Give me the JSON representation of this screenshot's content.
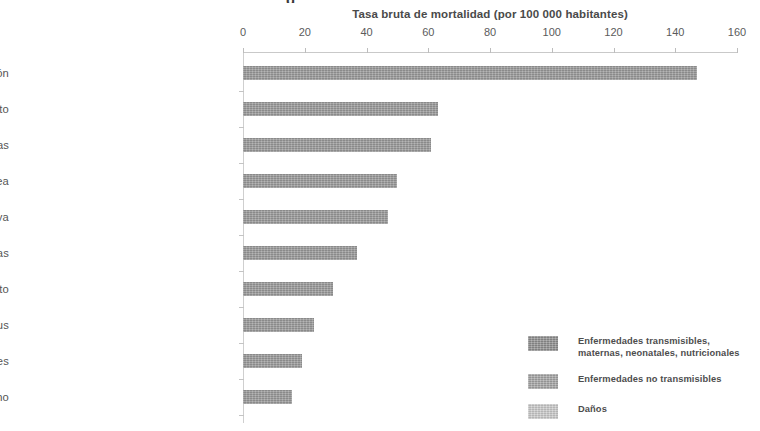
{
  "figure": {
    "clipped_title_fragment": "g",
    "axis_title": "Tasa bruta de mortalidad (por 100 000 habitantes)"
  },
  "legend": {
    "position": "bottom-right",
    "items": [
      {
        "label_line1": "Enfermedades transmisibles,",
        "label_line2": "maternas, neonatales, nutricionales",
        "color": "#8f8f8f"
      },
      {
        "label_line1": "Enfermedades no transmisibles",
        "label_line2": "",
        "color": "#a5a5a5"
      },
      {
        "label_line1": "Daños",
        "label_line2": "",
        "color": "#cacaca"
      }
    ]
  },
  "chart_data": {
    "type": "bar",
    "orientation": "horizontal",
    "title": "",
    "xlabel": "Tasa bruta de mortalidad (por 100 000 habitantes)",
    "ylabel": "",
    "xlim": [
      0,
      160
    ],
    "xticks": [
      0,
      20,
      40,
      60,
      80,
      100,
      120,
      140,
      160
    ],
    "grid": false,
    "legend_position": "bottom-right",
    "bar_color": "#9a9a9a",
    "categories": [
      "Enfermedad isquémica del corazón",
      "Infarto",
      "Alzheimer y otras demencias",
      "Cánceres de pulmón, tráquea",
      "Enfermedad pulmonar obstructiva",
      "Infecciones respiratorias",
      "Cáncer de colon y recto",
      "Diabetes mellitus",
      "Enfermedades renales",
      "Cáncer de pecho"
    ],
    "values": [
      147,
      63,
      61,
      50,
      47,
      37,
      29,
      23,
      19,
      16
    ],
    "series": [
      {
        "name": "Enfermedades no transmisibles",
        "values": [
          147,
          63,
          61,
          50,
          47,
          37,
          29,
          23,
          19,
          16
        ]
      }
    ]
  }
}
